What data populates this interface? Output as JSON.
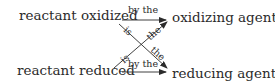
{
  "diagram": {
    "nodes": {
      "top_left": "reactant oxidized",
      "top_right": "oxidizing agent",
      "bottom_left": "reactant reduced",
      "bottom_right": "reducing agent"
    },
    "edge_labels": {
      "top_arrow": "by the",
      "bottom_arrow": "by the",
      "diag_down_is": "is",
      "diag_down_the": "the",
      "diag_up_is": "is",
      "diag_up_the": "the"
    },
    "colors": {
      "text": "#2b2b2b",
      "line": "#2b2b2b",
      "background": "#ffffff"
    }
  }
}
